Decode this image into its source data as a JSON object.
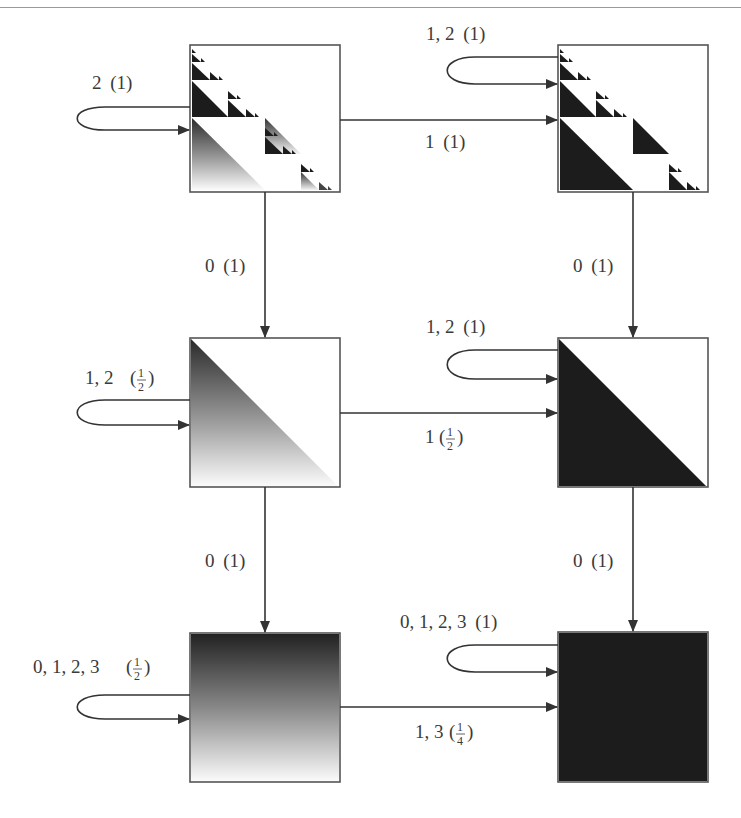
{
  "diagram": {
    "type": "state-transition-diagram",
    "colors": {
      "line": "#333333",
      "dark": "#1c1c1c",
      "label": "#3a3a3a",
      "background": "#ffffff"
    },
    "states": [
      {
        "id": "s_top_left",
        "fill": "sierpinski-gradient",
        "description": "Sierpinski-like staircase with gradient lower-left triangle"
      },
      {
        "id": "s_top_right",
        "fill": "sierpinski-solid",
        "description": "Sierpinski-like staircase with solid black lower-left triangle"
      },
      {
        "id": "s_mid_left",
        "fill": "triangle-gradient",
        "description": "Lower-left triangle with dark-to-light gradient"
      },
      {
        "id": "s_mid_right",
        "fill": "triangle-solid",
        "description": "Solid black lower-left triangle"
      },
      {
        "id": "s_bot_left",
        "fill": "square-gradient",
        "description": "Full square dark-to-light vertical gradient"
      },
      {
        "id": "s_bot_right",
        "fill": "square-solid",
        "description": "Full solid black square"
      }
    ],
    "edges": {
      "loop_top_left": {
        "digits": "2",
        "weight": "(1)"
      },
      "loop_top_right": {
        "digits": "1, 2",
        "weight": "(1)"
      },
      "top_horizontal": {
        "digits": "1",
        "weight": "(1)"
      },
      "left_down_1": {
        "digits": "0",
        "weight": "(1)"
      },
      "right_down_1": {
        "digits": "0",
        "weight": "(1)"
      },
      "loop_mid_left": {
        "digits": "1, 2",
        "weight_num": "1",
        "weight_den": "2"
      },
      "loop_mid_right": {
        "digits": "1, 2",
        "weight": "(1)"
      },
      "mid_horizontal": {
        "digits": "1",
        "weight_num": "1",
        "weight_den": "2"
      },
      "left_down_2": {
        "digits": "0",
        "weight": "(1)"
      },
      "right_down_2": {
        "digits": "0",
        "weight": "(1)"
      },
      "loop_bot_left": {
        "digits": "0, 1, 2, 3",
        "weight_num": "1",
        "weight_den": "2"
      },
      "loop_bot_right": {
        "digits": "0, 1, 2, 3",
        "weight": "(1)"
      },
      "bot_horizontal": {
        "digits": "1, 3",
        "weight_num": "1",
        "weight_den": "4"
      }
    }
  }
}
